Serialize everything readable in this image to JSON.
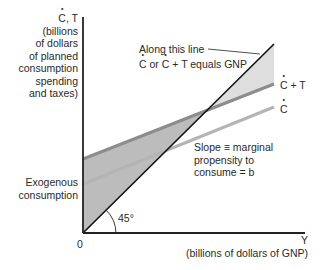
{
  "diagram": {
    "y_axis": {
      "symbol_main": "C",
      "symbol_rest": ", T",
      "caption_lines": [
        "(billions",
        "of dollars",
        "of planned",
        "consumption",
        "spending",
        "and taxes)"
      ]
    },
    "x_axis": {
      "symbol": "Y",
      "caption": "(billions of dollars of GNP)"
    },
    "origin_label": "0",
    "angle_label": "45°",
    "exogenous_label_lines": [
      "Exogenous",
      "consumption"
    ],
    "line_45_label": {
      "line1": "Along this line",
      "c1": "C",
      "mid": " or ",
      "c2": "C",
      "line2_rest": " + T equals GNP"
    },
    "ct_line_label": {
      "c": "C",
      "rest": " + T"
    },
    "c_line_label": {
      "c": "C"
    },
    "slope_label_lines": [
      "Slope ≡ marginal",
      "propensity to",
      "consume = b"
    ],
    "colors": {
      "axis": "#222222",
      "line_45": "#111111",
      "ct_line": "#8c8c8c",
      "c_line": "#b4b4b4",
      "shade_upper": "#dedede",
      "shade_lower": "#bcbcbc"
    }
  }
}
